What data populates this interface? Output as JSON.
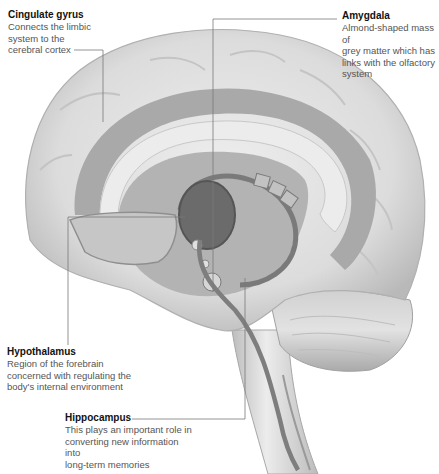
{
  "diagram": {
    "colors": {
      "background": "#ffffff",
      "brain_light": "#e6e6e6",
      "brain_mid": "#c9c9c9",
      "limbic_band": "#a9a9a9",
      "limbic_dark": "#6b6b6b",
      "leader_line": "#777777",
      "title_text": "#111111",
      "body_text": "#555555"
    },
    "labels": [
      {
        "id": "cingulate-gyrus",
        "title": "Cingulate gyrus",
        "description": "Connects the limbic\nsystem to the\ncerebral cortex"
      },
      {
        "id": "amygdala",
        "title": "Amygdala",
        "description": "Almond-shaped mass of\ngrey matter which has\nlinks with the olfactory\nsystem"
      },
      {
        "id": "hypothalamus",
        "title": "Hypothalamus",
        "description": "Region of the forebrain\nconcerned with regulating the\nbody's internal environment"
      },
      {
        "id": "hippocampus",
        "title": "Hippocampus",
        "description": "This plays an important role in\nconverting new information into\nlong-term memories"
      }
    ]
  }
}
